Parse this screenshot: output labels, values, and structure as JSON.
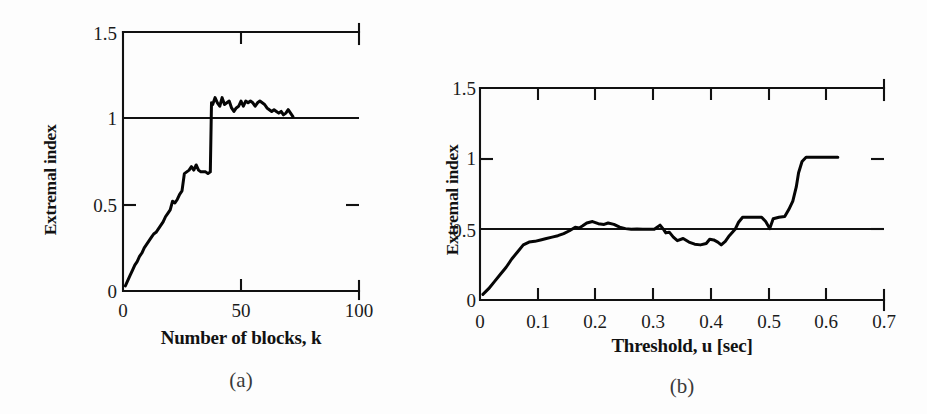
{
  "figure": {
    "background_color": "#fdfdfd",
    "line_color": "#050505",
    "axis_color": "#111111"
  },
  "panels": [
    {
      "id": "a",
      "caption": "(a)",
      "ylabel": "Extremal index",
      "xlabel": "Number of blocks, k",
      "x_ticks": [
        "0",
        "50",
        "100"
      ],
      "y_ticks": [
        "0",
        "0.5",
        "1",
        "1.5"
      ]
    },
    {
      "id": "b",
      "caption": "(b)",
      "ylabel": "Extremal index",
      "xlabel": "Threshold, u [sec]",
      "x_ticks": [
        "0",
        "0.1",
        "0.2",
        "0.3",
        "0.4",
        "0.5",
        "0.6",
        "0.7"
      ],
      "y_ticks": [
        "0",
        "0.5",
        "1",
        "1.5"
      ]
    }
  ],
  "chart_data": [
    {
      "type": "line",
      "panel": "a",
      "title": "",
      "xlabel": "Number of blocks, k",
      "ylabel": "Extremal index",
      "xlim": [
        0,
        100
      ],
      "ylim": [
        0,
        1.5
      ],
      "xticks": [
        0,
        50,
        100
      ],
      "yticks": [
        0,
        0.5,
        1,
        1.5
      ],
      "grid": false,
      "legend": "none",
      "annotations": [
        {
          "kind": "hline",
          "y": 1.0,
          "label": "reference level 1"
        }
      ],
      "series": [
        {
          "name": "extremal index vs number of blocks",
          "x": [
            1,
            2,
            3,
            4,
            5,
            6,
            7,
            8,
            9,
            10,
            11,
            12,
            13,
            14,
            15,
            16,
            17,
            18,
            19,
            20,
            21,
            22,
            23,
            24,
            25,
            26,
            27,
            28,
            29,
            30,
            31,
            32,
            33,
            34,
            35,
            36,
            37,
            37.5,
            38,
            39,
            40,
            41,
            42,
            43,
            44,
            45,
            46,
            47,
            48,
            49,
            50,
            51,
            52,
            53,
            54,
            55,
            56,
            57,
            58,
            59,
            60,
            61,
            62,
            63,
            64,
            65,
            66,
            67,
            68,
            69,
            70,
            71,
            72
          ],
          "y": [
            0.03,
            0.06,
            0.09,
            0.12,
            0.15,
            0.17,
            0.2,
            0.22,
            0.25,
            0.27,
            0.29,
            0.31,
            0.33,
            0.34,
            0.36,
            0.38,
            0.4,
            0.43,
            0.45,
            0.47,
            0.52,
            0.51,
            0.53,
            0.56,
            0.58,
            0.68,
            0.69,
            0.7,
            0.72,
            0.7,
            0.73,
            0.7,
            0.69,
            0.69,
            0.69,
            0.68,
            0.69,
            1.09,
            1.08,
            1.12,
            1.09,
            1.07,
            1.12,
            1.08,
            1.09,
            1.1,
            1.06,
            1.04,
            1.06,
            1.07,
            1.1,
            1.07,
            1.1,
            1.09,
            1.1,
            1.09,
            1.07,
            1.09,
            1.1,
            1.09,
            1.08,
            1.06,
            1.05,
            1.04,
            1.05,
            1.04,
            1.03,
            1.04,
            1.02,
            1.03,
            1.05,
            1.03,
            1.01
          ]
        }
      ]
    },
    {
      "type": "line",
      "panel": "b",
      "title": "",
      "xlabel": "Threshold, u [sec]",
      "ylabel": "Extremal index",
      "xlim": [
        0,
        0.7
      ],
      "ylim": [
        0,
        1.5
      ],
      "xticks": [
        0,
        0.1,
        0.2,
        0.3,
        0.4,
        0.5,
        0.6,
        0.7
      ],
      "yticks": [
        0,
        0.5,
        1,
        1.5
      ],
      "grid": false,
      "legend": "none",
      "annotations": [
        {
          "kind": "hline",
          "y": 0.5,
          "label": "reference level 0.5"
        }
      ],
      "series": [
        {
          "name": "extremal index vs threshold",
          "x": [
            0.005,
            0.015,
            0.025,
            0.035,
            0.045,
            0.055,
            0.065,
            0.075,
            0.085,
            0.095,
            0.105,
            0.115,
            0.125,
            0.135,
            0.145,
            0.155,
            0.165,
            0.172,
            0.178,
            0.185,
            0.195,
            0.205,
            0.215,
            0.222,
            0.232,
            0.242,
            0.252,
            0.262,
            0.272,
            0.282,
            0.292,
            0.302,
            0.312,
            0.318,
            0.322,
            0.328,
            0.335,
            0.342,
            0.352,
            0.362,
            0.372,
            0.382,
            0.392,
            0.398,
            0.405,
            0.412,
            0.418,
            0.425,
            0.432,
            0.442,
            0.448,
            0.455,
            0.472,
            0.488,
            0.495,
            0.502,
            0.508,
            0.518,
            0.528,
            0.535,
            0.542,
            0.548,
            0.552,
            0.558,
            0.565,
            0.58,
            0.6,
            0.62
          ],
          "y": [
            0.04,
            0.08,
            0.13,
            0.18,
            0.23,
            0.29,
            0.34,
            0.39,
            0.41,
            0.415,
            0.425,
            0.435,
            0.445,
            0.455,
            0.47,
            0.49,
            0.515,
            0.51,
            0.525,
            0.545,
            0.555,
            0.54,
            0.535,
            0.545,
            0.535,
            0.515,
            0.505,
            0.5,
            0.502,
            0.5,
            0.5,
            0.5,
            0.53,
            0.5,
            0.475,
            0.48,
            0.445,
            0.42,
            0.435,
            0.41,
            0.395,
            0.39,
            0.4,
            0.43,
            0.425,
            0.41,
            0.39,
            0.415,
            0.455,
            0.5,
            0.55,
            0.585,
            0.585,
            0.585,
            0.555,
            0.505,
            0.575,
            0.585,
            0.59,
            0.64,
            0.7,
            0.8,
            0.9,
            0.98,
            1.01,
            1.01,
            1.01,
            1.01
          ]
        }
      ]
    }
  ]
}
